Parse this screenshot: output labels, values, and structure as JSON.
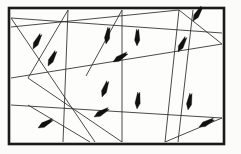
{
  "figure": {
    "width": 241,
    "height": 154,
    "background_color": "#fbfbf9",
    "frame": {
      "name": "border-rectangle",
      "x": 9,
      "y": 8,
      "width": 215,
      "height": 136,
      "stroke_color": "#1a1a1a",
      "stroke_width": 2.6,
      "fill_color": "#fdfdfb"
    },
    "line_color": "#2b2b2b",
    "line_width": 0.85,
    "arrow_color": "#111111",
    "arrow_length": 17,
    "arrow_width": 5.2
  },
  "chart_data": {
    "type": "scatter",
    "subtitle": "",
    "xlabel": "",
    "ylabel": "",
    "xlim": [
      0,
      241
    ],
    "ylim": [
      0,
      154
    ],
    "grid": false,
    "legend": "none",
    "annotations": [],
    "segments": [
      {
        "id": "s1",
        "x1": 11,
        "y1": 18,
        "x2": 222,
        "y2": 33,
        "arrow_t": 0.82,
        "arrow_dir": "forward"
      },
      {
        "id": "s2",
        "x1": 11,
        "y1": 27,
        "x2": 179,
        "y2": 10,
        "arrow_t": 0.5,
        "arrow_dir": "forward"
      },
      {
        "id": "s3",
        "x1": 68,
        "y1": 10,
        "x2": 28,
        "y2": 78,
        "arrow_t": 0.45,
        "arrow_dir": "forward"
      },
      {
        "id": "s4",
        "x1": 68,
        "y1": 10,
        "x2": 63,
        "y2": 142,
        "arrow_t": 0.52,
        "arrow_dir": "forward"
      },
      {
        "id": "s5",
        "x1": 122,
        "y1": 10,
        "x2": 86,
        "y2": 76,
        "arrow_t": 0.4,
        "arrow_dir": "forward"
      },
      {
        "id": "s6",
        "x1": 122,
        "y1": 10,
        "x2": 122,
        "y2": 142,
        "arrow_t": 0.34,
        "arrow_dir": "forward"
      },
      {
        "id": "s7",
        "x1": 179,
        "y1": 10,
        "x2": 165,
        "y2": 142,
        "arrow_t": 0.28,
        "arrow_dir": "forward"
      },
      {
        "id": "s8",
        "x1": 179,
        "y1": 10,
        "x2": 222,
        "y2": 44,
        "arrow_t": 0.45,
        "arrow_dir": "forward"
      },
      {
        "id": "s9",
        "x1": 11,
        "y1": 78,
        "x2": 222,
        "y2": 44,
        "arrow_t": 0.72,
        "arrow_dir": "forward"
      },
      {
        "id": "s10",
        "x1": 11,
        "y1": 105,
        "x2": 222,
        "y2": 118,
        "arrow_t": 0.28,
        "arrow_dir": "forward"
      },
      {
        "id": "s11",
        "x1": 28,
        "y1": 78,
        "x2": 122,
        "y2": 142,
        "arrow_t": 0.52,
        "arrow_dir": "forward"
      },
      {
        "id": "s12",
        "x1": 28,
        "y1": 105,
        "x2": 90,
        "y2": 142,
        "arrow_t": 0.48,
        "arrow_dir": "forward"
      },
      {
        "id": "s13",
        "x1": 222,
        "y1": 118,
        "x2": 165,
        "y2": 142,
        "arrow_t": 0.55,
        "arrow_dir": "forward"
      },
      {
        "id": "s14",
        "x1": 193,
        "y1": 10,
        "x2": 178,
        "y2": 142,
        "arrow_t": 0.62,
        "arrow_dir": "forward"
      },
      {
        "id": "s15",
        "x1": 11,
        "y1": 18,
        "x2": 95,
        "y2": 142,
        "arrow_t": 0.22,
        "arrow_dir": "forward"
      }
    ],
    "arrows": [
      {
        "id": "a1",
        "x": 33,
        "y": 49,
        "angle": 118
      },
      {
        "id": "a2",
        "x": 48,
        "y": 66,
        "angle": 118
      },
      {
        "id": "a3",
        "x": 106,
        "y": 44,
        "angle": 100
      },
      {
        "id": "a4",
        "x": 137,
        "y": 46,
        "angle": 92
      },
      {
        "id": "a5",
        "x": 113,
        "y": 62,
        "angle": 148
      },
      {
        "id": "a6",
        "x": 178,
        "y": 52,
        "angle": 118
      },
      {
        "id": "a7",
        "x": 193,
        "y": 21,
        "angle": 122
      },
      {
        "id": "a8",
        "x": 102,
        "y": 97,
        "angle": 110
      },
      {
        "id": "a9",
        "x": 137,
        "y": 109,
        "angle": 96
      },
      {
        "id": "a10",
        "x": 94,
        "y": 117,
        "angle": 150
      },
      {
        "id": "a11",
        "x": 38,
        "y": 128,
        "angle": 150
      },
      {
        "id": "a12",
        "x": 188,
        "y": 110,
        "angle": 100
      },
      {
        "id": "a13",
        "x": 199,
        "y": 127,
        "angle": 152
      }
    ]
  }
}
